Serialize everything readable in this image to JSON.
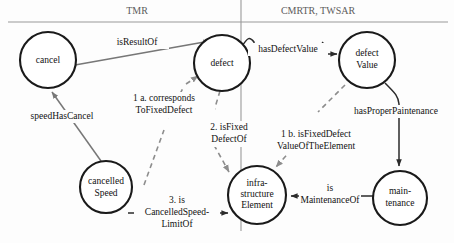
{
  "diagram": {
    "canvas": {
      "width": 454,
      "height": 243
    },
    "colors": {
      "node_stroke": "#1a1a1a",
      "node_fill": "#ffffff",
      "edge_dark": "#2b2b2b",
      "edge_gray": "#777777",
      "edge_dashed": "#8d8d8d",
      "divider": "#9a9a9a",
      "header_text": "#5c5c5c",
      "label_text": "#111111",
      "background": "#fdfdfd"
    },
    "headers": [
      {
        "id": "left-header",
        "label": "TMR",
        "x": 137,
        "y": 12
      },
      {
        "id": "right-header",
        "label": "CMRTR, TWSAR",
        "x": 318,
        "y": 12
      }
    ],
    "dividers": {
      "horizontal_y": 22,
      "vertical_x": 241,
      "vertical_y_start": 0,
      "vertical_y_end": 231
    },
    "nodes": [
      {
        "id": "cancel",
        "lines": [
          "cancel"
        ],
        "cx": 48,
        "cy": 60,
        "r": 28
      },
      {
        "id": "defect",
        "lines": [
          "defect"
        ],
        "cx": 222,
        "cy": 63,
        "r": 28
      },
      {
        "id": "defect-value",
        "lines": [
          "defect",
          "Value"
        ],
        "cx": 367,
        "cy": 60,
        "r": 28
      },
      {
        "id": "cancelled-speed",
        "lines": [
          "cancelled",
          "Speed"
        ],
        "cx": 106,
        "cy": 187,
        "r": 26
      },
      {
        "id": "infrastructure-element",
        "lines": [
          "infra-",
          "structure",
          "Element"
        ],
        "cx": 257,
        "cy": 195,
        "r": 29
      },
      {
        "id": "maintenance",
        "lines": [
          "main-",
          "tenance"
        ],
        "cx": 400,
        "cy": 198,
        "r": 27
      }
    ],
    "edges": [
      {
        "id": "is-result-of",
        "label_lines": [
          "isResultOf"
        ],
        "label_x": 137,
        "label_y": 43,
        "from": "cancel",
        "to": "defect",
        "style": "solid-gray",
        "arrow": "to"
      },
      {
        "id": "has-defect-value",
        "label_lines": [
          "hasDefectValue"
        ],
        "label_x": 288,
        "label_y": 50,
        "from": "defect",
        "to": "defect-value",
        "style": "solid-dark",
        "arrow": "to"
      },
      {
        "id": "speed-has-cancel",
        "label_lines": [
          "speedHasCancel"
        ],
        "label_x": 62,
        "label_y": 117,
        "from": "cancelled-speed",
        "to": "cancel",
        "style": "solid-gray",
        "arrow": "to"
      },
      {
        "id": "corresponds-to-fixed-defect",
        "label_lines": [
          "1 a. corresponds",
          "ToFixedDefect"
        ],
        "label_x": 164,
        "label_y": 105,
        "from": "cancelled-speed",
        "to": "defect",
        "style": "dashed",
        "arrow": "to",
        "number": "1 a."
      },
      {
        "id": "is-fixed-defect-of",
        "label_lines": [
          "2. isFixed",
          "DefectOf"
        ],
        "label_x": 229,
        "label_y": 134,
        "from": "defect",
        "to": "infrastructure-element",
        "style": "dashed",
        "arrow": "to",
        "number": "2."
      },
      {
        "id": "is-fixed-defect-value-of-the-element",
        "label_lines": [
          "1 b. isFixedDefect",
          "ValueOfTheElement"
        ],
        "label_x": 316,
        "label_y": 141,
        "from": "defect-value",
        "to": "infrastructure-element",
        "style": "dashed",
        "arrow": "to",
        "number": "1 b."
      },
      {
        "id": "has-proper-paintenance",
        "label_lines": [
          "hasProperPaintenance"
        ],
        "label_x": 396,
        "label_y": 112,
        "from": "defect-value",
        "to": "maintenance",
        "style": "solid-dark",
        "arrow": "to"
      },
      {
        "id": "is-maintenance-of",
        "label_lines": [
          "is",
          "MaintenanceOf"
        ],
        "label_x": 330,
        "label_y": 196,
        "from": "maintenance",
        "to": "infrastructure-element",
        "style": "solid-dark",
        "arrow": "to"
      },
      {
        "id": "is-cancelled-speed-limit-of",
        "label_lines": [
          "3. is",
          "CancelledSpeed-",
          "LimitOf"
        ],
        "label_x": 175,
        "label_y": 212,
        "from": "cancelled-speed",
        "to": "infrastructure-element",
        "style": "solid-dark",
        "arrow": "to",
        "number": "3."
      }
    ]
  }
}
